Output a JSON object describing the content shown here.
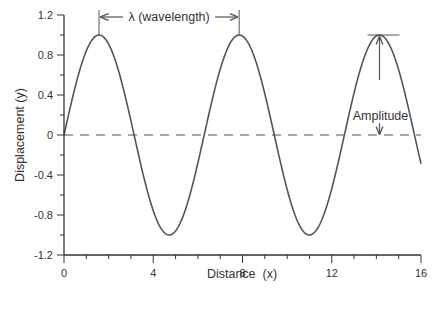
{
  "chart_data": {
    "type": "line",
    "title": "",
    "xlabel": "Distance  (x)",
    "ylabel": "Displacement (y)",
    "xlim": [
      0,
      16
    ],
    "ylim": [
      -1.2,
      1.2
    ],
    "x_ticks": [
      "0",
      "4",
      "8",
      "12",
      "16"
    ],
    "x_tick_values": [
      0,
      4,
      8,
      12,
      16
    ],
    "x_minor_step": 1,
    "y_ticks": [
      "1.2",
      "0.8",
      "0.4",
      "0",
      "-0.4",
      "-0.8",
      "-1.2"
    ],
    "y_tick_values": [
      1.2,
      0.8,
      0.4,
      0,
      -0.4,
      -0.8,
      -1.2
    ],
    "y_minor_step": 0.2,
    "grid": false,
    "legend": null,
    "series": [
      {
        "name": "wave",
        "function": "y = sin(x)",
        "style": "solid",
        "color": "#555555",
        "x": [
          0,
          1,
          1.57,
          2,
          3,
          3.14,
          4,
          4.71,
          5,
          6,
          6.28,
          7,
          7.85,
          8,
          9,
          9.42,
          10,
          10.99,
          11,
          12,
          12.57,
          13,
          14,
          14.14,
          15,
          16
        ],
        "y": [
          0,
          0.84,
          1.0,
          0.91,
          0.14,
          0,
          -0.76,
          -1.0,
          -0.96,
          -0.28,
          0,
          0.66,
          1.0,
          0.99,
          0.41,
          0,
          -0.54,
          -1.0,
          -1.0,
          -0.54,
          0,
          0.42,
          0.99,
          1.0,
          0.65,
          -0.29
        ]
      },
      {
        "name": "equilibrium",
        "function": "y = 0",
        "style": "dashed",
        "color": "#555555",
        "x": [
          0,
          16
        ],
        "y": [
          0,
          0
        ]
      }
    ],
    "annotations": [
      {
        "text": "λ (wavelength)",
        "type": "double-arrow-horizontal",
        "x_from": 1.57,
        "x_to": 7.85,
        "y": 1.1
      },
      {
        "text": "Amplitude",
        "type": "double-arrow-vertical",
        "x": 14.14,
        "y_from": 0,
        "y_to": 1.0
      }
    ]
  },
  "labels": {
    "wavelength": "λ (wavelength)",
    "amplitude": "Amplitude"
  },
  "colors": {
    "line": "#555555",
    "axis": "#333333",
    "text": "#333333",
    "background": "#ffffff"
  }
}
